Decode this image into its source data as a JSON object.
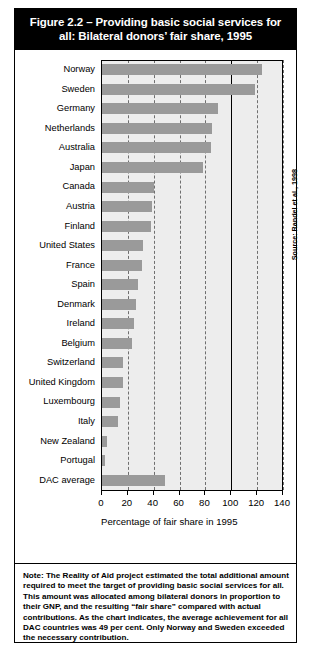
{
  "figure": {
    "title": "Figure 2.2 – Providing basic social services for all: Bilateral donors’ fair share, 1995",
    "source": "Source: Randel et al., 1998",
    "note": "Note: The Reality of Aid project estimated the total additional amount required to meet the target of providing basic social services for all. This amount was allocated among bilateral donors in proportion to their GNP, and the resulting “fair share” compared with actual contributions. As the chart indicates, the average achievement for all DAC countries was 49 per cent. Only Norway and Sweden exceeded the necessary contribution."
  },
  "chart_data": {
    "type": "bar",
    "orientation": "horizontal",
    "title": "Figure 2.2 – Providing basic social services for all: Bilateral donors’ fair share, 1995",
    "xlabel": "Percentage of fair share in 1995",
    "ylabel": "",
    "xlim": [
      0,
      140
    ],
    "xticks": [
      0,
      20,
      40,
      60,
      80,
      100,
      120,
      140
    ],
    "grid": "vertical-dashed",
    "legend": "none",
    "reference_line": {
      "value": 100,
      "style": "solid",
      "color": "#000000"
    },
    "bar_color": "#9a9a9a",
    "plot_background": "#ededed",
    "categories": [
      "Norway",
      "Sweden",
      "Germany",
      "Netherlands",
      "Australia",
      "Japan",
      "Canada",
      "Austria",
      "Finland",
      "United States",
      "France",
      "Spain",
      "Denmark",
      "Ireland",
      "Belgium",
      "Switzerland",
      "United Kingdom",
      "Luxembourg",
      "Italy",
      "New Zealand",
      "Portugal",
      "DAC average"
    ],
    "values": [
      124,
      118,
      90,
      85,
      84,
      78,
      40,
      39,
      38,
      32,
      31,
      28,
      26,
      25,
      23,
      16,
      16,
      14,
      12,
      4,
      2,
      49
    ]
  }
}
